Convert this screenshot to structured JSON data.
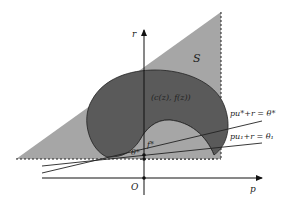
{
  "diagram": {
    "type": "geometric-plot",
    "axes": {
      "x_label": "p",
      "y_label": "r",
      "origin_label": "O"
    },
    "regions": {
      "feasible_set_label": "S",
      "feasible_set_color": "#a6a6a6",
      "inner_set_label": "(c(z), f(z))",
      "inner_set_color": "#5a5a5a"
    },
    "points": {
      "theta_star_label": "θ*",
      "f_star_label": "f*"
    },
    "lines": [
      {
        "label": "pu*+r = θ*",
        "id": "optimal-supporting-line"
      },
      {
        "label": "pu₁+r = θ₁",
        "id": "supporting-line-1"
      }
    ],
    "colors": {
      "axis": "#111111",
      "line": "#222222",
      "background": "#ffffff"
    }
  }
}
